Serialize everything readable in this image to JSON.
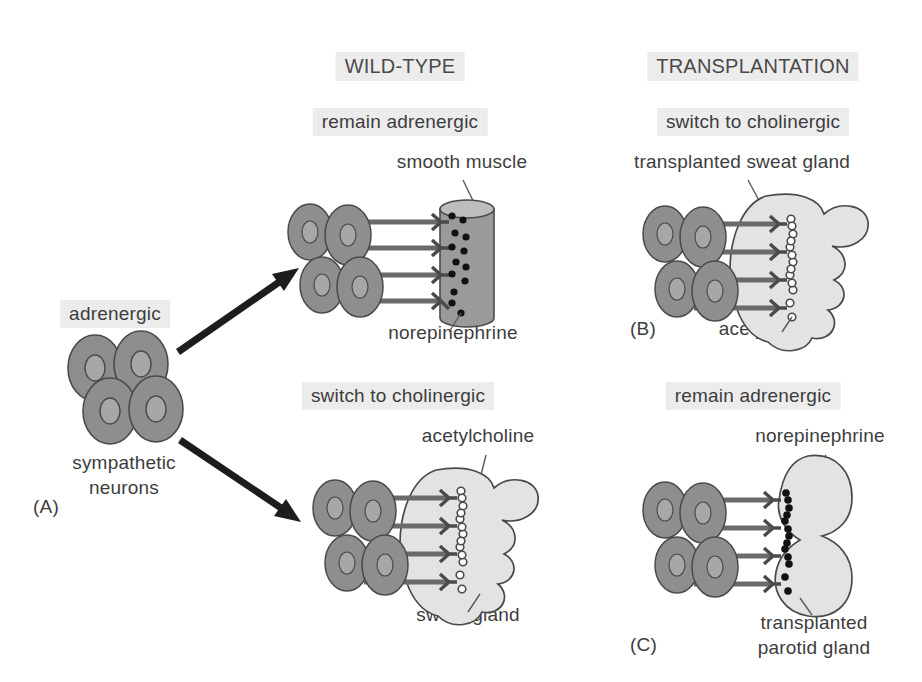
{
  "figure": {
    "columns": [
      {
        "id": "wild-type",
        "header": "WILD-TYPE"
      },
      {
        "id": "transplantation",
        "header": "TRANSPLANTATION"
      }
    ],
    "source_panel": {
      "id": "A",
      "panel_label": "(A)",
      "state_label": "adrenergic",
      "caption_line1": "sympathetic",
      "caption_line2": "neurons",
      "neuron_count": 4
    },
    "panels": [
      {
        "id": "wildtype-smooth-muscle",
        "panel_label": "",
        "condition": "remain adrenergic",
        "target_label": "smooth muscle",
        "transmitter_label": "norepinephrine",
        "target_shape": "cylinder",
        "transmitter_style": "filled-dot",
        "axon_count": 4,
        "vesicle_count": 13
      },
      {
        "id": "transplant-sweat-gland",
        "panel_label": "(B)",
        "condition": "switch to cholinergic",
        "target_label": "transplanted sweat gland",
        "transmitter_label": "acetylcholine",
        "target_shape": "lobed-gland",
        "transmitter_style": "open-circle",
        "axon_count": 4,
        "vesicle_count": 13
      },
      {
        "id": "wildtype-sweat-gland",
        "panel_label": "",
        "condition": "switch to cholinergic",
        "target_label": "sweat gland",
        "transmitter_label": "acetylcholine",
        "target_shape": "lobed-gland",
        "transmitter_style": "open-circle",
        "axon_count": 4,
        "vesicle_count": 13
      },
      {
        "id": "transplant-parotid-gland",
        "panel_label": "(C)",
        "condition": "remain adrenergic",
        "target_label_line1": "transplanted",
        "target_label_line2": "parotid gland",
        "transmitter_label": "norepinephrine",
        "target_shape": "peanut-gland",
        "transmitter_style": "filled-dot",
        "axon_count": 4,
        "vesicle_count": 13
      }
    ],
    "arrows": [
      {
        "id": "arrow-to-wildtype-top",
        "direction": "up-right"
      },
      {
        "id": "arrow-to-wildtype-bottom",
        "direction": "down-right"
      }
    ],
    "colors": {
      "neuron_body": "#8e8e8e",
      "neuron_nucleus": "#a7a7a7",
      "smooth_muscle": "#9a9a9a",
      "smooth_muscle_top": "#bdbdbd",
      "gland_light": "#e3e3e3",
      "outline": "#4a4a4a",
      "highlight_band": "#ececec",
      "text": "#3d3d3d",
      "arrow": "#1d1d1d",
      "vesicle_filled": "#111111",
      "vesicle_open": "#ffffff"
    }
  }
}
